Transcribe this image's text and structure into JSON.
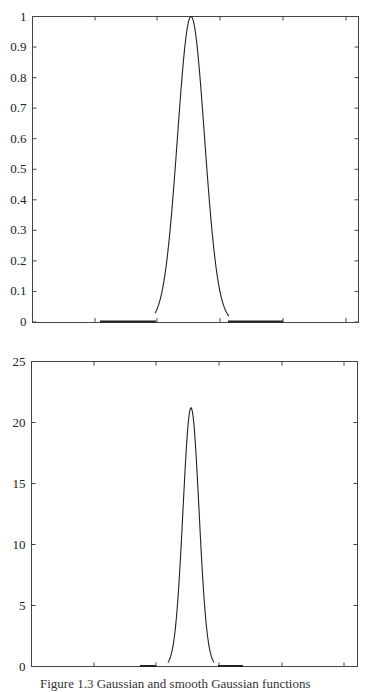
{
  "chart_data": [
    {
      "type": "line",
      "title": "",
      "xlabel": "",
      "ylabel": "",
      "ylim": [
        0,
        1
      ],
      "yticks": [
        "0",
        "0.1",
        "0.2",
        "0.3",
        "0.4",
        "0.5",
        "0.6",
        "0.7",
        "0.8",
        "0.9",
        "1"
      ],
      "xticks_labeled": false,
      "grid": false,
      "legend": null,
      "series": [
        {
          "name": "gaussian",
          "peak_value": 1.0,
          "x": [
            -1.0,
            -0.8,
            -0.6,
            -0.4,
            -0.3,
            -0.2,
            -0.1,
            0.0,
            0.1,
            0.2,
            0.3,
            0.4,
            0.6,
            0.8,
            1.0
          ],
          "values": [
            0.0,
            0.0,
            0.0,
            0.01,
            0.08,
            0.32,
            0.75,
            1.0,
            0.75,
            0.32,
            0.08,
            0.01,
            0.0,
            0.0,
            0.0
          ]
        }
      ],
      "annotations": [
        "thick baseline segments on either side of peak"
      ]
    },
    {
      "type": "line",
      "title": "",
      "xlabel": "",
      "ylabel": "",
      "ylim": [
        0,
        25
      ],
      "yticks": [
        "0",
        "5",
        "10",
        "15",
        "20",
        "25"
      ],
      "xticks_labeled": false,
      "grid": false,
      "legend": null,
      "series": [
        {
          "name": "narrow-peak",
          "peak_value": 21.2,
          "x": [
            -1.0,
            -0.4,
            -0.25,
            -0.18,
            -0.12,
            -0.06,
            0.0,
            0.06,
            0.12,
            0.18,
            0.25,
            0.4,
            1.0
          ],
          "values": [
            0.0,
            0.0,
            0.1,
            1.5,
            6.5,
            15.5,
            21.2,
            15.5,
            6.5,
            1.5,
            0.1,
            0.0,
            0.0
          ]
        }
      ],
      "annotations": [
        "thick baseline segments on either side of peak"
      ]
    }
  ],
  "caption": "Figure 1.3   Gaussian and smooth Gaussian functions"
}
